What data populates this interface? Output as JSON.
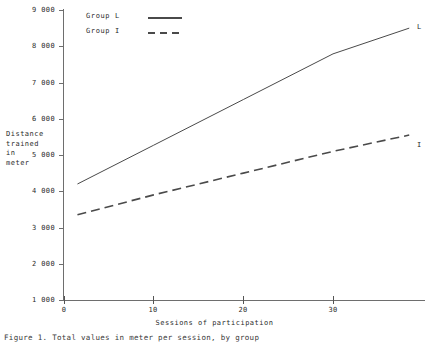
{
  "figure": {
    "caption": "Figure 1. Total values in meter per session, by group",
    "background": "#ffffff",
    "line_color": "#4a4a4a",
    "axis_color": "#6e6e6e",
    "text_color": "#2b2b2b"
  },
  "axes": {
    "y_title_lines": [
      "Distance",
      "trained",
      "in",
      "meter"
    ],
    "y_title": "Distance trained in meter",
    "x_title": "Sessions of participation",
    "y_ticks": [
      "9 000",
      "8 000",
      "7 000",
      "6 000",
      "5 000",
      "4 000",
      "3 000",
      "2 000",
      "1 000"
    ],
    "x_ticks": [
      "0",
      "10",
      "20",
      "30"
    ]
  },
  "legend": {
    "items": [
      {
        "label": "Group L",
        "style": "solid"
      },
      {
        "label": "Group I",
        "style": "dashed"
      }
    ]
  },
  "series_end_labels": {
    "group_l": "L",
    "group_i": "I"
  },
  "chart_data": {
    "type": "line",
    "title": "",
    "xlabel": "Sessions of participation",
    "ylabel": "Distance trained in meter",
    "xlim": [
      0,
      40
    ],
    "ylim": [
      1000,
      9000
    ],
    "xticks": [
      0,
      10,
      20,
      30
    ],
    "yticks": [
      1000,
      2000,
      3000,
      4000,
      5000,
      6000,
      7000,
      8000,
      9000
    ],
    "grid": false,
    "legend_position": "top-left-inside",
    "series": [
      {
        "name": "Group L",
        "style": "solid",
        "end_label": "L",
        "x": [
          1.5,
          10,
          20,
          30,
          38.5
        ],
        "values": [
          4200,
          5270,
          6530,
          7790,
          8500
        ]
      },
      {
        "name": "Group I",
        "style": "dashed",
        "end_label": "I",
        "x": [
          1.5,
          10,
          20,
          30,
          38.5
        ],
        "values": [
          3350,
          3900,
          4500,
          5100,
          5550
        ]
      }
    ]
  }
}
